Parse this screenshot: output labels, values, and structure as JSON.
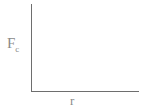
{
  "chart_data": {
    "type": "line",
    "title": "",
    "xlabel": "r",
    "ylabel": "F_c",
    "ylabel_main": "F",
    "ylabel_sub": "c",
    "series": [],
    "grid": false,
    "legend": null
  }
}
